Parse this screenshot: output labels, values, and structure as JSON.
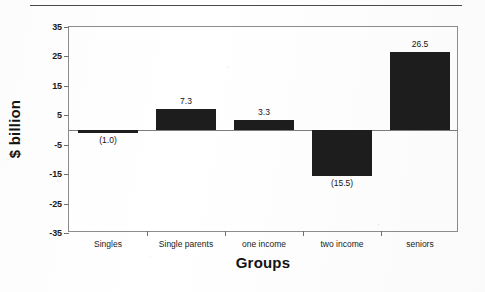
{
  "chart_data": {
    "type": "bar",
    "title": "",
    "subtitle": "",
    "xlabel": "Groups",
    "ylabel": "$ billion",
    "categories": [
      "Singles",
      "Single parents",
      "one income",
      "two income",
      "seniors"
    ],
    "values": [
      -1.0,
      7.3,
      3.3,
      -15.5,
      26.5
    ],
    "point_labels": [
      "(1.0)",
      "7.3",
      "3.3",
      "(15.5)",
      "26.5"
    ],
    "ylim": [
      -35,
      35
    ],
    "yticks": [
      35,
      25,
      15,
      5,
      -5,
      -15,
      -25,
      -35
    ],
    "ytick_labels": [
      "35",
      "25",
      "15",
      "5",
      "-5",
      "-15",
      "-25",
      "-35"
    ],
    "grid": false,
    "legend": false,
    "legend_position": "none",
    "bar_color": "#1d1d1d",
    "frame_color": "#8d8d8d",
    "negative_label_format": "parentheses",
    "annotations": [
      "horizontal rule above plot"
    ]
  },
  "colors": {
    "background": "#ffffff",
    "bar": "#1d1d1d",
    "axis": "#8d8d8d",
    "text": "#131313",
    "rule": "#4a4a4a"
  }
}
